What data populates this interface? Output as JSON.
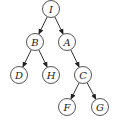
{
  "diagram": {
    "type": "binary-tree",
    "radius": 8.5,
    "colors": {
      "stroke": "#555555",
      "fill": "#ffffff",
      "text": "#222222",
      "edge": "#333333"
    },
    "nodes": [
      {
        "id": "I",
        "label": "I",
        "x": 51,
        "y": 9
      },
      {
        "id": "B",
        "label": "B",
        "x": 35,
        "y": 42
      },
      {
        "id": "A",
        "label": "A",
        "x": 67,
        "y": 42
      },
      {
        "id": "D",
        "label": "D",
        "x": 19,
        "y": 75
      },
      {
        "id": "H",
        "label": "H",
        "x": 51,
        "y": 75
      },
      {
        "id": "C",
        "label": "C",
        "x": 83,
        "y": 75
      },
      {
        "id": "F",
        "label": "F",
        "x": 67,
        "y": 107
      },
      {
        "id": "G",
        "label": "G",
        "x": 100,
        "y": 107
      }
    ],
    "edges": [
      {
        "from": "I",
        "to": "B"
      },
      {
        "from": "I",
        "to": "A"
      },
      {
        "from": "B",
        "to": "D"
      },
      {
        "from": "B",
        "to": "H"
      },
      {
        "from": "A",
        "to": "C"
      },
      {
        "from": "C",
        "to": "F"
      },
      {
        "from": "C",
        "to": "G"
      }
    ]
  }
}
